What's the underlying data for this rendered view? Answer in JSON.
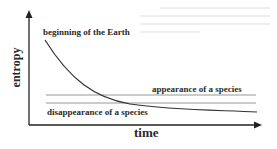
{
  "diagram": {
    "x_axis_label": "time",
    "y_axis_label": "entropy",
    "annotations": {
      "start": "beginning of the Earth",
      "upper_line": "appearance of a species",
      "lower_line": "disappearance of a species"
    },
    "colors": {
      "curve": "#333333",
      "lines": "#888888",
      "axes": "#222222",
      "text": "#2a2a2a"
    }
  }
}
